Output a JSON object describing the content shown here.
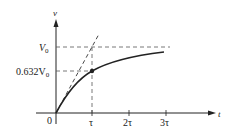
{
  "diagram": {
    "axes": {
      "y_label": "v",
      "x_label": "t",
      "origin_label": "0"
    },
    "y_ticks": [
      {
        "label_main": "V",
        "label_sub": "0",
        "value": "V0"
      },
      {
        "label_main": "0.632V",
        "label_sub": "0",
        "value": "0.632V0"
      }
    ],
    "x_ticks": [
      {
        "label": "τ"
      },
      {
        "label": "2τ"
      },
      {
        "label": "3τ"
      }
    ],
    "curve": {
      "equation": "v(t) = V0 (1 - e^(-t/τ))",
      "marked_point": {
        "t": "τ",
        "v": "0.632V0"
      }
    },
    "tangent": {
      "description": "initial slope tangent reaching V0 at t = τ",
      "style": "dashed"
    },
    "colors": {
      "line": "#222222",
      "dash": "#555555",
      "background": "#ffffff"
    }
  }
}
